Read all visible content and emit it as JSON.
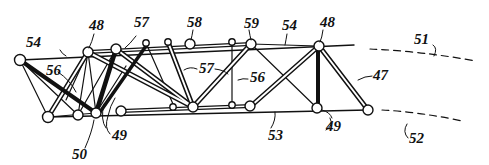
{
  "figure": {
    "type": "patent line drawing",
    "labels": [
      {
        "text": "54",
        "x": 26,
        "y": 47
      },
      {
        "text": "48",
        "x": 89,
        "y": 30
      },
      {
        "text": "57",
        "x": 134,
        "y": 27
      },
      {
        "text": "58",
        "x": 187,
        "y": 27
      },
      {
        "text": "59",
        "x": 244,
        "y": 28
      },
      {
        "text": "54",
        "x": 282,
        "y": 30
      },
      {
        "text": "48",
        "x": 320,
        "y": 27
      },
      {
        "text": "51",
        "x": 414,
        "y": 44
      },
      {
        "text": "56",
        "x": 46,
        "y": 75
      },
      {
        "text": "57",
        "x": 199,
        "y": 73
      },
      {
        "text": "56",
        "x": 250,
        "y": 82
      },
      {
        "text": "47",
        "x": 373,
        "y": 80
      },
      {
        "text": "53",
        "x": 268,
        "y": 140
      },
      {
        "text": "49",
        "x": 112,
        "y": 140
      },
      {
        "text": "49",
        "x": 326,
        "y": 131
      },
      {
        "text": "50",
        "x": 72,
        "y": 159
      },
      {
        "text": "52",
        "x": 409,
        "y": 143
      }
    ],
    "colors": {
      "ink": "#111111",
      "paper": "#ffffff"
    }
  }
}
